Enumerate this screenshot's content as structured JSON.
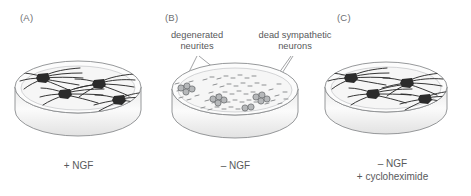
{
  "figure": {
    "colors": {
      "text": "#58595b",
      "dish_outline": "#8a8c8e",
      "dish_wall": "#f2f2f2",
      "medium": "#f7f7f7",
      "healthy_neuron": "#2b2b2b",
      "dead_neuron": "#8e9092",
      "leader_line": "#8a8c8e"
    }
  },
  "panels": [
    {
      "letter": "(A)",
      "caption": "+ NGF",
      "state": "healthy",
      "neuron_count": 4,
      "callouts": []
    },
    {
      "letter": "(B)",
      "caption": "– NGF",
      "state": "degenerated",
      "neuron_count": 4,
      "callouts": [
        {
          "label": "degenerated\nneurites"
        },
        {
          "label": "dead sympathetic\nneurons"
        }
      ]
    },
    {
      "letter": "(C)",
      "caption": "– NGF\n+ cycloheximide",
      "state": "healthy",
      "neuron_count": 4,
      "callouts": []
    }
  ]
}
